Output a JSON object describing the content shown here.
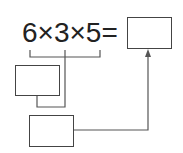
{
  "equation": {
    "text": "6×3×5=",
    "operands": [
      "6",
      "3",
      "5"
    ],
    "operator": "×",
    "equals": "="
  },
  "boxes": {
    "answer_box": "",
    "intermediate_box": "",
    "second_step_box": ""
  },
  "colors": {
    "text": "#222222",
    "lines": "#555555",
    "box_border": "#444444",
    "background": "#ffffff"
  }
}
